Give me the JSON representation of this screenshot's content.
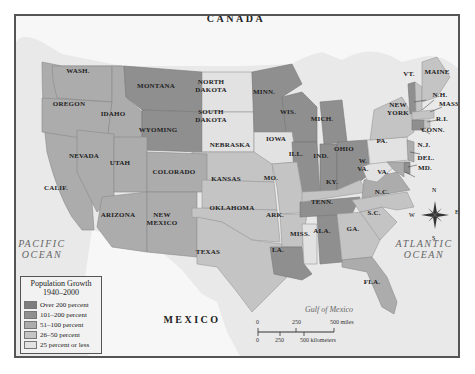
{
  "map": {
    "type": "choropleth",
    "title": "Population Growth 1940–2000",
    "countries": [
      {
        "name": "CANADA",
        "x": 234,
        "y": 16
      },
      {
        "name": "MEXICO",
        "x": 190,
        "y": 317
      }
    ],
    "oceans": [
      {
        "name": "PACIFIC\nOCEAN",
        "line1": "PACIFIC",
        "line2": "OCEAN"
      },
      {
        "name": "ATLANTIC\nOCEAN",
        "line1": "ATLANTIC",
        "line2": "OCEAN"
      }
    ],
    "gulf": "Gulf of Mexico",
    "colors": {
      "over_200": "#7e7e7e",
      "101_200": "#8f8f8f",
      "51_100": "#acacac",
      "26_50": "#c4c4c4",
      "25_or_less": "#e2e2e2",
      "water": "#e9e9e9",
      "foreign_land": "#f7f7f7"
    },
    "states": [
      {
        "label": "WASH.",
        "category": "51_100"
      },
      {
        "label": "OREGON",
        "category": "51_100"
      },
      {
        "label": "IDAHO",
        "category": "51_100"
      },
      {
        "label": "MONTANA",
        "category": "101_200"
      },
      {
        "label": "WYOMING",
        "category": "101_200"
      },
      {
        "label": "NORTH DAKOTA",
        "category": "25_or_less"
      },
      {
        "label": "SOUTH DAKOTA",
        "category": "25_or_less"
      },
      {
        "label": "NEBRASKA",
        "category": "26_50"
      },
      {
        "label": "IOWA",
        "category": "25_or_less"
      },
      {
        "label": "MINN.",
        "category": "101_200"
      },
      {
        "label": "WIS.",
        "category": "101_200"
      },
      {
        "label": "MICH.",
        "category": "101_200"
      },
      {
        "label": "ILL.",
        "category": "101_200"
      },
      {
        "label": "IND.",
        "category": "101_200"
      },
      {
        "label": "OHIO",
        "category": "101_200"
      },
      {
        "label": "NEVADA",
        "category": "51_100"
      },
      {
        "label": "UTAH",
        "category": "51_100"
      },
      {
        "label": "COLORADO",
        "category": "51_100"
      },
      {
        "label": "CALIF.",
        "category": "51_100"
      },
      {
        "label": "ARIZONA",
        "category": "51_100"
      },
      {
        "label": "NEW MEXICO",
        "category": "51_100"
      },
      {
        "label": "KANSAS",
        "category": "26_50"
      },
      {
        "label": "OKLAHOMA",
        "category": "26_50"
      },
      {
        "label": "TEXAS",
        "category": "26_50"
      },
      {
        "label": "MO.",
        "category": "26_50"
      },
      {
        "label": "ARK.",
        "category": "26_50"
      },
      {
        "label": "LA.",
        "category": "101_200"
      },
      {
        "label": "MISS.",
        "category": "25_or_less"
      },
      {
        "label": "ALA.",
        "category": "101_200"
      },
      {
        "label": "TENN.",
        "category": "101_200"
      },
      {
        "label": "KY.",
        "category": "26_50"
      },
      {
        "label": "GA.",
        "category": "26_50"
      },
      {
        "label": "FLA.",
        "category": "51_100"
      },
      {
        "label": "S.C.",
        "category": "26_50"
      },
      {
        "label": "N.C.",
        "category": "26_50"
      },
      {
        "label": "VA.",
        "category": "51_100"
      },
      {
        "label": "W. VA.",
        "category": "25_or_less"
      },
      {
        "label": "PA.",
        "category": "25_or_less"
      },
      {
        "label": "NEW YORK",
        "category": "26_50"
      },
      {
        "label": "VT.",
        "category": "101_200"
      },
      {
        "label": "MAINE",
        "category": "26_50"
      },
      {
        "label": "N.H.",
        "category": "26_50"
      },
      {
        "label": "MASS.",
        "category": "26_50"
      },
      {
        "label": "R.I.",
        "category": "26_50"
      },
      {
        "label": "CONN.",
        "category": "101_200"
      },
      {
        "label": "N.J.",
        "category": "51_100"
      },
      {
        "label": "DEL.",
        "category": "101_200"
      },
      {
        "label": "MD.",
        "category": "51_100"
      }
    ],
    "labels": {
      "wash": "WASH.",
      "oregon": "OREGON",
      "idaho": "IDAHO",
      "montana": "MONTANA",
      "wyoming": "WYOMING",
      "nd1": "NORTH",
      "nd2": "DAKOTA",
      "sd1": "SOUTH",
      "sd2": "DAKOTA",
      "nebraska": "NEBRASKA",
      "iowa": "IOWA",
      "minn": "MINN.",
      "wis": "WIS.",
      "mich": "MICH.",
      "ill": "ILL.",
      "ind": "IND.",
      "ohio": "OHIO",
      "nevada": "NEVADA",
      "utah": "UTAH",
      "colorado": "COLORADO",
      "calif": "CALIF.",
      "arizona": "ARIZONA",
      "nm1": "NEW",
      "nm2": "MEXICO",
      "kansas": "KANSAS",
      "oklahoma": "OKLAHOMA",
      "texas": "TEXAS",
      "mo": "MO.",
      "ark": "ARK.",
      "la": "LA.",
      "miss": "MISS.",
      "ala": "ALA.",
      "tenn": "TENN.",
      "ky": "KY.",
      "ga": "GA.",
      "fla": "FLA.",
      "sc": "S.C.",
      "nc": "N.C.",
      "va": "VA.",
      "wva1": "W.",
      "wva2": "VA.",
      "pa": "PA.",
      "ny1": "NEW",
      "ny2": "YORK",
      "vt": "VT.",
      "maine": "MAINE",
      "nh": "N.H.",
      "mass": "MASS.",
      "ri": "R.I.",
      "conn": "CONN.",
      "nj": "N.J.",
      "del": "DEL.",
      "md": "MD."
    },
    "legend": {
      "title_line1": "Population Growth",
      "title_line2": "1940–2000",
      "items": [
        {
          "label": "Over 200 percent",
          "color": "#7e7e7e"
        },
        {
          "label": "101–200 percent",
          "color": "#8f8f8f"
        },
        {
          "label": "51–100 percent",
          "color": "#acacac"
        },
        {
          "label": "26–50 percent",
          "color": "#c4c4c4"
        },
        {
          "label": "25 percent or less",
          "color": "#e2e2e2"
        }
      ]
    },
    "scale": {
      "miles": [
        "0",
        "250",
        "500 miles"
      ],
      "kilometers": [
        "0",
        "250",
        "500 kilometers"
      ]
    },
    "compass": {
      "n": "N",
      "s": "S",
      "e": "E",
      "w": "W"
    }
  }
}
